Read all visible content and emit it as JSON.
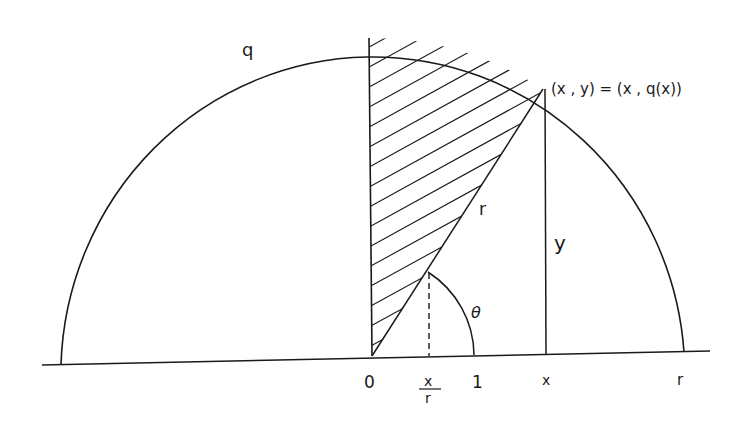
{
  "diagram": {
    "labels": {
      "curve": "q",
      "point": "(x , y) = (x , q(x))",
      "radius": "r",
      "height": "y",
      "angle": "θ",
      "origin": "0",
      "x_over_r_num": "x",
      "x_over_r_den": "r",
      "one": "1",
      "x_axis_x": "x",
      "x_axis_r": "r"
    },
    "colors": {
      "stroke": "#1a1a1a",
      "background": "#ffffff"
    }
  }
}
